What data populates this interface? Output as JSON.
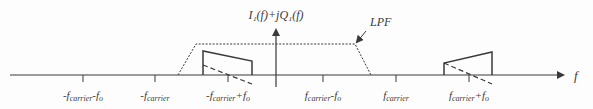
{
  "diagram": {
    "title_label": "I₁(f)+jQ₁(f)",
    "filter_label": "LPF",
    "axis_label": "f",
    "ticks": [
      {
        "id": "neg-fc-minus-fo",
        "label_main": "-f",
        "label_sub": "carrier",
        "label_rest": "-f",
        "label_rest_sub": "o",
        "x": 83
      },
      {
        "id": "neg-fc",
        "label_main": "-f",
        "label_sub": "carrier",
        "label_rest": "",
        "label_rest_sub": "",
        "x": 155
      },
      {
        "id": "neg-fc-plus-fo",
        "label_main": "-f",
        "label_sub": "carrier",
        "label_rest": "+f",
        "label_rest_sub": "o",
        "x": 228
      },
      {
        "id": "fc-minus-fo",
        "label_main": "f",
        "label_sub": "carrier",
        "label_rest": "-f",
        "label_rest_sub": "o",
        "x": 323
      },
      {
        "id": "fc",
        "label_main": "f",
        "label_sub": "carrier",
        "label_rest": "",
        "label_rest_sub": "",
        "x": 396
      },
      {
        "id": "fc-plus-fo",
        "label_main": "f",
        "label_sub": "carrier",
        "label_rest": "+f",
        "label_rest_sub": "o",
        "x": 469
      }
    ],
    "colors": {
      "line": "#3a3a3a",
      "background": "#fdfdfd"
    }
  }
}
